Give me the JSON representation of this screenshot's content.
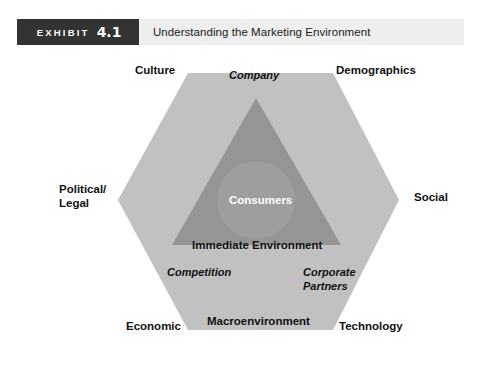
{
  "exhibit": {
    "tag_word": "EXHIBIT",
    "tag_number": "4.1",
    "title": "Understanding the Marketing Environment"
  },
  "diagram": {
    "outer_labels": {
      "culture": "Culture",
      "demographics": "Demographics",
      "political_legal_line1": "Political/",
      "political_legal_line2": "Legal",
      "social": "Social",
      "economic": "Economic",
      "technology": "Technology"
    },
    "inner_labels": {
      "company": "Company",
      "consumers": "Consumers",
      "immediate_environment": "Immediate Environment",
      "competition": "Competition",
      "corporate_partners_line1": "Corporate",
      "corporate_partners_line2": "Partners",
      "macroenvironment": "Macroenvironment"
    }
  },
  "colors": {
    "tag_background": "#333333",
    "header_background": "#eeeeee",
    "hexagon_fill": "#c1c1c1",
    "triangle_fill": "#959595",
    "circle_fill": "#9e9e9e",
    "page_background": "#ffffff",
    "text_dark": "#111111",
    "text_light": "#ffffff"
  }
}
